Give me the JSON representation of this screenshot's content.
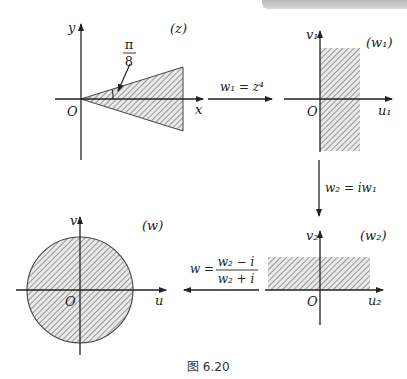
{
  "figure": {
    "caption": "图 6.20",
    "colors": {
      "ink": "#222222",
      "hatch": "#555555",
      "fill": "#e6e6e6",
      "topbar": "#c4c4c4"
    }
  },
  "z_plane": {
    "plane_label": "(z)",
    "x_label": "x",
    "y_label": "y",
    "origin_label": "O",
    "angle_num": "π",
    "angle_den": "8",
    "region": "wedge |arg z| < π/8"
  },
  "w1_plane": {
    "plane_label": "(w₁)",
    "x_label": "u₁",
    "y_label": "v₁",
    "origin_label": "O",
    "region": "right half-plane strip"
  },
  "w2_plane": {
    "plane_label": "(w₂)",
    "x_label": "u₂",
    "y_label": "v₂",
    "origin_label": "O",
    "region": "upper half-plane strip"
  },
  "w_plane": {
    "plane_label": "(w)",
    "x_label": "u",
    "y_label": "v",
    "origin_label": "O",
    "region": "unit disk"
  },
  "mappings": {
    "map1": "w₁ = z⁴",
    "map2": "w₂ = iw₁",
    "map3_lhs": "w =",
    "map3_num": "w₂ − i",
    "map3_den": "w₂ + i"
  }
}
